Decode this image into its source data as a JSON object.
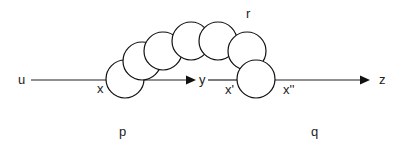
{
  "diagram": {
    "labels": {
      "u": "u",
      "x": "x",
      "y": "y",
      "x_prime": "x'",
      "x_double_prime": "x''",
      "z": "z",
      "r": "r",
      "p": "p",
      "q": "q"
    },
    "circles": [
      {
        "cx": 125,
        "cy": 79,
        "r": 19
      },
      {
        "cx": 142,
        "cy": 61,
        "r": 19
      },
      {
        "cx": 163,
        "cy": 51,
        "r": 19
      },
      {
        "cx": 191,
        "cy": 41,
        "r": 19
      },
      {
        "cx": 218,
        "cy": 41,
        "r": 19
      },
      {
        "cx": 247,
        "cy": 51,
        "r": 19
      },
      {
        "cx": 256,
        "cy": 79,
        "r": 19
      }
    ],
    "colors": {
      "stroke": "#111111",
      "text": "#222222",
      "background": "#ffffff"
    }
  }
}
